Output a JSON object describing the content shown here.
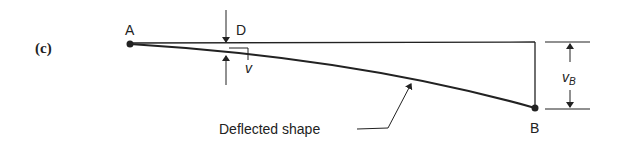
{
  "figure": {
    "panel_label": "(c)",
    "points": {
      "A": "A",
      "B": "B",
      "D": "D"
    },
    "symbols": {
      "v": "v",
      "vB_main": "v",
      "vB_sub": "B"
    },
    "annotation": "Deflected shape",
    "colors": {
      "line": "#222222",
      "background": "#ffffff"
    }
  }
}
